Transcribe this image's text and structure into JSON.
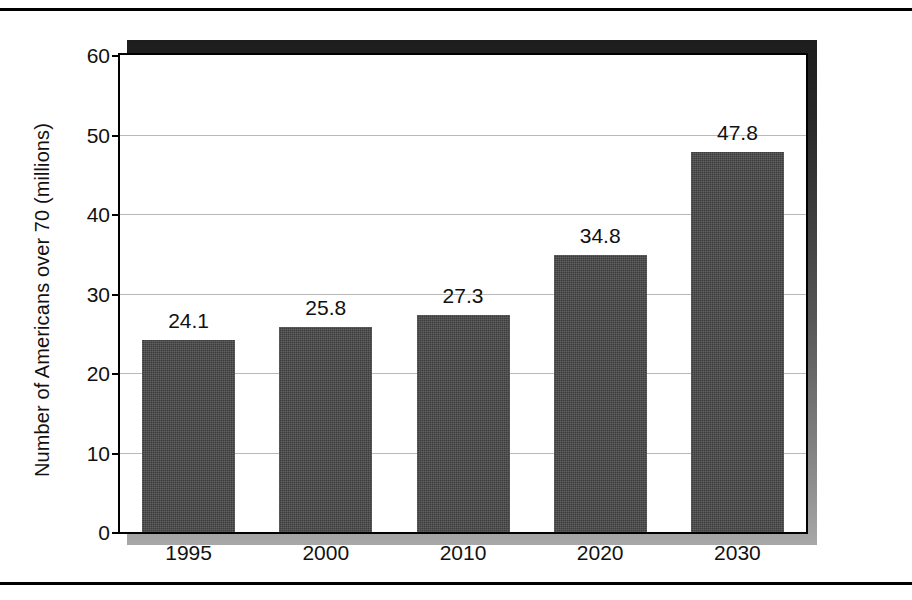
{
  "chart_data": {
    "type": "bar",
    "title": "",
    "xlabel": "",
    "ylabel": "Number of Americans over 70 (millions)",
    "categories": [
      "1995",
      "2000",
      "2010",
      "2020",
      "2030"
    ],
    "values": [
      24.1,
      25.8,
      27.3,
      34.8,
      47.8
    ],
    "value_labels": [
      "24.1",
      "25.8",
      "27.3",
      "34.8",
      "47.8"
    ],
    "ylim": [
      0,
      60
    ],
    "yticks": [
      0,
      10,
      20,
      30,
      40,
      50,
      60
    ],
    "ytick_labels": [
      "0",
      "10",
      "20",
      "30",
      "40",
      "50",
      "60"
    ],
    "grid": "horizontal",
    "legend": "none",
    "bar_color": "#3c3c3c",
    "gridline_color": "#b9b9b9",
    "axis_color": "#000000",
    "background_color": "#ffffff"
  }
}
